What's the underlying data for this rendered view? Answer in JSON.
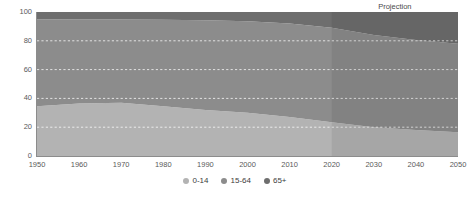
{
  "chart_data": {
    "type": "area",
    "stacked": true,
    "normalized_percent": true,
    "title": "",
    "subtitle": "",
    "xlabel": "",
    "ylabel": "",
    "x": [
      1950,
      1960,
      1970,
      1980,
      1990,
      2000,
      2010,
      2020,
      2030,
      2040,
      2050
    ],
    "categories": [
      "1950",
      "1960",
      "1970",
      "1980",
      "1990",
      "2000",
      "2010",
      "2020",
      "2030",
      "2040",
      "2050"
    ],
    "series": [
      {
        "name": "0-14",
        "values": [
          34.5,
          36.5,
          37.0,
          34.5,
          32.0,
          30.0,
          27.0,
          23.5,
          20.0,
          18.0,
          16.5
        ]
      },
      {
        "name": "15-64",
        "values": [
          60.5,
          58.3,
          57.8,
          60.2,
          62.2,
          63.5,
          65.0,
          65.5,
          64.0,
          62.5,
          61.5
        ]
      },
      {
        "name": "65+",
        "values": [
          5.0,
          5.2,
          5.2,
          5.3,
          5.8,
          6.5,
          8.0,
          11.0,
          16.0,
          19.5,
          22.0
        ]
      }
    ],
    "xlim": [
      1950,
      2050
    ],
    "ylim": [
      0,
      100
    ],
    "y_ticks": [
      0,
      20,
      40,
      60,
      80,
      100
    ],
    "y_tick_labels": [
      "0",
      "20",
      "40",
      "60",
      "80",
      "100"
    ],
    "x_ticks": [
      1950,
      1960,
      1970,
      1980,
      1990,
      2000,
      2010,
      2020,
      2030,
      2040,
      2050
    ],
    "x_tick_labels": [
      "1950",
      "1960",
      "1970",
      "1980",
      "1990",
      "2000",
      "2010",
      "2020",
      "2030",
      "2040",
      "2050"
    ],
    "grid": true,
    "grid_style": "dashed",
    "grid_axis": "y",
    "legend_position": "bottom-center",
    "annotations": [
      {
        "text": "Projection",
        "x": 2035,
        "position": "above-plot"
      }
    ],
    "projection_start_x": 2020,
    "colors": {
      "series_0_14": "#b3b3b3",
      "series_15_64": "#8c8c8c",
      "series_65_plus": "#6e6e6e",
      "projection_overlay": "#00000012",
      "gridline": "#ffffff",
      "axis": "#8c8c8c",
      "tick_label": "#5a5a5a",
      "annotation_text": "#4a4a4a",
      "background": "#ffffff"
    }
  },
  "legend": {
    "items": [
      {
        "label": "0-14",
        "color": "#b3b3b3"
      },
      {
        "label": "15-64",
        "color": "#8c8c8c"
      },
      {
        "label": "65+",
        "color": "#6e6e6e"
      }
    ]
  },
  "annotation": {
    "projection_label": "Projection"
  }
}
